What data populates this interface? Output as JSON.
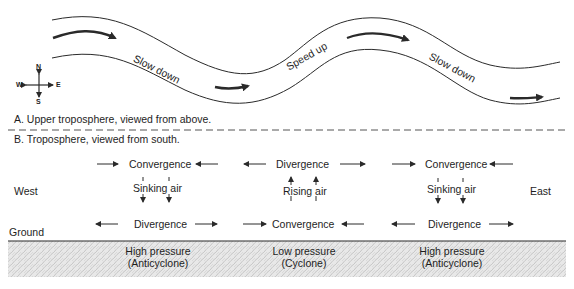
{
  "panel_a": {
    "caption": "A. Upper troposphere, viewed from above.",
    "flow_labels": [
      "Slow down",
      "Speed up",
      "Slow down"
    ],
    "compass": {
      "north": "N",
      "south": "S",
      "east": "E",
      "west": "W"
    }
  },
  "panel_b": {
    "caption": "B. Troposphere, viewed from south.",
    "west_label": "West",
    "east_label": "East",
    "ground_label": "Ground",
    "columns": [
      {
        "top": "Convergence",
        "vertical": "Sinking air",
        "bottom": "Divergence",
        "pressure_line1": "High pressure",
        "pressure_line2": "(Anticyclone)"
      },
      {
        "top": "Divergence",
        "vertical": "Rising air",
        "bottom": "Convergence",
        "pressure_line1": "Low pressure",
        "pressure_line2": "(Cyclone)"
      },
      {
        "top": "Convergence",
        "vertical": "Sinking air",
        "bottom": "Divergence",
        "pressure_line1": "High pressure",
        "pressure_line2": "(Anticyclone)"
      }
    ]
  },
  "colors": {
    "line": "#2a2a2a",
    "ground_texture": "#cfcfcf",
    "ground_base": "#e6e6e6"
  }
}
